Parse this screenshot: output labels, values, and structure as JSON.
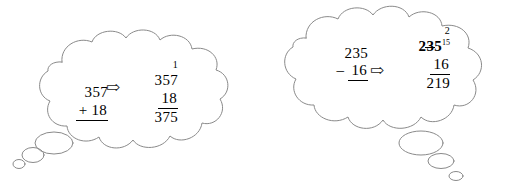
{
  "scene": {
    "title": "Two thought bubbles showing vertical arithmetic regrouping",
    "background_color": "#ffffff",
    "outline_color": "#8a8a8a",
    "ink_color": "#000000"
  },
  "bubbles": [
    {
      "id": "addition",
      "name": "addition-thought-bubble",
      "tail_direction": "bottom-left",
      "tail_bubble_count": 3,
      "before": {
        "carry": "",
        "line1": "357",
        "operator": "+",
        "line2": "18",
        "result": ""
      },
      "arrow": {
        "glyph": "⇨",
        "name": "transformation-arrow"
      },
      "after": {
        "carry": "1",
        "line1": "357",
        "operator": "",
        "line2": "18",
        "result": "375"
      }
    },
    {
      "id": "subtraction",
      "name": "subtraction-thought-bubble",
      "tail_direction": "bottom-right",
      "tail_bubble_count": 3,
      "before": {
        "carry": "",
        "line1": "235",
        "operator": "–",
        "line2": "16",
        "result": ""
      },
      "arrow": {
        "glyph": "⇨",
        "name": "transformation-arrow"
      },
      "after": {
        "carry": "2",
        "line1_prefix": "2",
        "line1_struck": "3",
        "line1_suffix": "5",
        "line1_superscript": "15",
        "operator": "",
        "line2": "16",
        "result": "219"
      }
    }
  ]
}
